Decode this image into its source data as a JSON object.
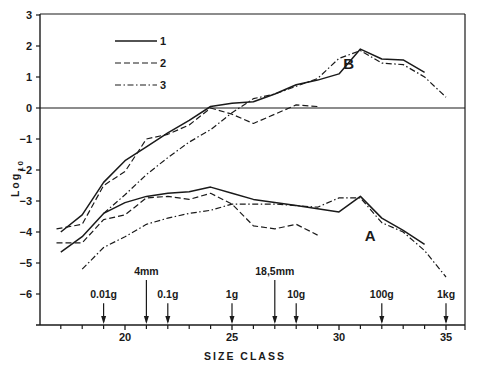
{
  "chart_data": {
    "type": "line",
    "title": "",
    "xlabel": "SIZE CLASS",
    "ylabel": "Log10",
    "xlim": [
      16,
      36
    ],
    "ylim": [
      -7,
      3
    ],
    "x_ticks": [
      20,
      25,
      30,
      35
    ],
    "x_minor_ticks": [
      17,
      18,
      19,
      21,
      22,
      23,
      24,
      26,
      27,
      28,
      29,
      31,
      32,
      33,
      34
    ],
    "y_ticks": [
      3,
      2,
      1,
      0,
      -1,
      -2,
      -3,
      -4,
      -5,
      -6
    ],
    "grid": false,
    "reference_line": 0,
    "legend": {
      "position": "upper-left",
      "entries": [
        {
          "label": "1",
          "style": "solid"
        },
        {
          "label": "2",
          "style": "dashed"
        },
        {
          "label": "3",
          "style": "dash-dot"
        }
      ]
    },
    "curve_labels": [
      {
        "text": "B",
        "x": 30.2,
        "y": 1.25
      },
      {
        "text": "A",
        "x": 31.2,
        "y": -4.3
      }
    ],
    "annotations": [
      {
        "text": "0.01g",
        "x": 19,
        "arrow_top": -6.3
      },
      {
        "text": "4mm",
        "x": 21,
        "arrow_top": -5.55
      },
      {
        "text": "0.1g",
        "x": 22,
        "arrow_top": -6.3
      },
      {
        "text": "1g",
        "x": 25,
        "arrow_top": -6.3
      },
      {
        "text": "18,5mm",
        "x": 27,
        "arrow_top": -5.55
      },
      {
        "text": "10g",
        "x": 28,
        "arrow_top": -6.3
      },
      {
        "text": "100g",
        "x": 32,
        "arrow_top": -6.3
      },
      {
        "text": "1kg",
        "x": 35,
        "arrow_top": -6.3
      }
    ],
    "series": [
      {
        "name": "1",
        "group": "B",
        "style": "solid",
        "x": [
          17,
          18,
          19,
          20,
          21,
          22,
          23,
          24,
          25,
          26,
          27,
          28,
          29,
          30,
          31,
          32,
          33,
          34
        ],
        "y": [
          -4.0,
          -3.45,
          -2.4,
          -1.7,
          -1.25,
          -0.8,
          -0.4,
          0.05,
          0.15,
          0.2,
          0.45,
          0.75,
          0.9,
          1.1,
          1.9,
          1.58,
          1.55,
          1.15
        ]
      },
      {
        "name": "2",
        "group": "B",
        "style": "dashed",
        "x": [
          16.8,
          18,
          19,
          20,
          21,
          22,
          23,
          24,
          25,
          26,
          27,
          28,
          29
        ],
        "y": [
          -3.9,
          -3.75,
          -2.5,
          -2.05,
          -1.0,
          -0.85,
          -0.55,
          0.0,
          -0.2,
          -0.5,
          -0.2,
          0.1,
          0.05
        ]
      },
      {
        "name": "3",
        "group": "B",
        "style": "dash-dot",
        "x": [
          19,
          20,
          21,
          22,
          23,
          24,
          25,
          26,
          27,
          28,
          29,
          30,
          31,
          32,
          33,
          34,
          35
        ],
        "y": [
          -3.4,
          -2.8,
          -2.15,
          -1.6,
          -1.1,
          -0.7,
          -0.15,
          0.3,
          0.45,
          0.7,
          0.95,
          1.6,
          1.85,
          1.45,
          1.4,
          1.0,
          0.35
        ]
      },
      {
        "name": "1",
        "group": "A",
        "style": "solid",
        "x": [
          17,
          18,
          19,
          20,
          21,
          22,
          23,
          24,
          25,
          26,
          27,
          28,
          29,
          30,
          31,
          32,
          33,
          34
        ],
        "y": [
          -4.65,
          -4.15,
          -3.4,
          -3.05,
          -2.85,
          -2.75,
          -2.7,
          -2.55,
          -2.75,
          -2.95,
          -3.05,
          -3.15,
          -3.25,
          -3.35,
          -2.85,
          -3.55,
          -3.95,
          -4.4
        ]
      },
      {
        "name": "2",
        "group": "A",
        "style": "dashed",
        "x": [
          16.8,
          18,
          19,
          20,
          21,
          22,
          23,
          24,
          25,
          26,
          27,
          28,
          29
        ],
        "y": [
          -4.35,
          -4.35,
          -3.6,
          -3.45,
          -2.9,
          -2.85,
          -2.95,
          -2.75,
          -3.1,
          -3.8,
          -3.9,
          -3.75,
          -4.1
        ]
      },
      {
        "name": "3",
        "group": "A",
        "style": "dash-dot",
        "x": [
          18,
          19,
          20,
          21,
          22,
          23,
          24,
          25,
          26,
          27,
          28,
          29,
          30,
          31,
          32,
          33,
          34,
          35
        ],
        "y": [
          -5.2,
          -4.5,
          -4.15,
          -3.75,
          -3.55,
          -3.4,
          -3.3,
          -3.1,
          -3.1,
          -3.1,
          -3.15,
          -3.2,
          -2.9,
          -2.9,
          -3.7,
          -4.0,
          -4.6,
          -5.45
        ]
      }
    ]
  }
}
